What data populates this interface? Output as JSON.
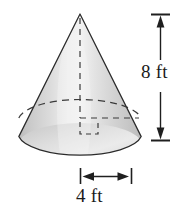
{
  "figure": {
    "name": "cone-diagram",
    "shape": "cone",
    "height_label": "8 ft",
    "diameter_label": "4 ft",
    "colors": {
      "outline": "#2b2b2b",
      "dashed": "#3a3a3a",
      "body_light": "#efefef",
      "body_mid": "#d6d6d6",
      "body_dark": "#b9b9b9",
      "background": "#ffffff",
      "text": "#1a1a1a"
    },
    "geometry": {
      "apex_x": 80,
      "apex_y": 14,
      "base_center_x": 80,
      "base_center_y": 145,
      "base_rx": 62,
      "base_ry": 22,
      "hidden_ellipse_center_y": 118,
      "hidden_ellipse_rx": 62,
      "hidden_ellipse_ry": 22
    },
    "dimensions": {
      "height": {
        "name": "height-dimension",
        "value": "8 ft",
        "orientation": "vertical",
        "axis_x": 160,
        "top_y": 14,
        "bottom_y": 140,
        "tick_half_width": 9
      },
      "diameter": {
        "name": "diameter-dimension",
        "value": "4 ft",
        "orientation": "horizontal",
        "axis_y": 176,
        "left_x": 80,
        "right_x": 128,
        "tick_half_height": 8,
        "left_tick_x": 80,
        "right_tick_x": 131
      }
    },
    "right_angle_marker": {
      "name": "right-angle-marker",
      "corner_x": 80,
      "corner_y": 118,
      "size": 16
    }
  }
}
